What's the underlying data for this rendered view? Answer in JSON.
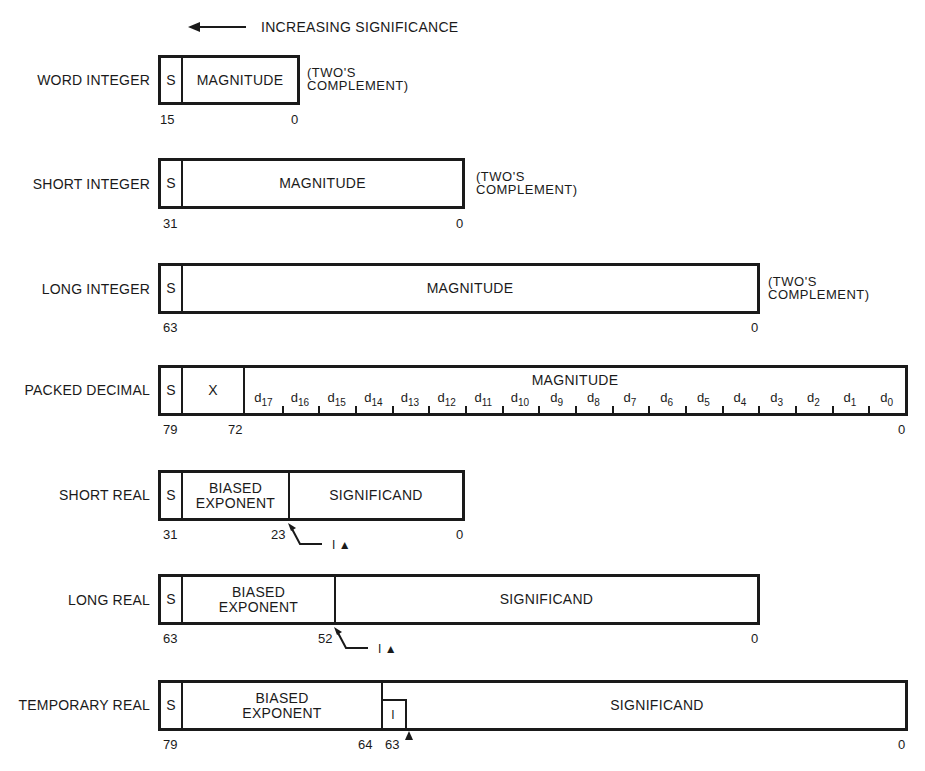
{
  "header": {
    "arrow_label": "INCREASING SIGNIFICANCE"
  },
  "formats": {
    "word_integer": {
      "label": "WORD INTEGER",
      "sign": "S",
      "field": "MAGNITUDE",
      "note_line1": "(TWO'S",
      "note_line2": "COMPLEMENT)",
      "bit_high": "15",
      "bit_low": "0"
    },
    "short_integer": {
      "label": "SHORT INTEGER",
      "sign": "S",
      "field": "MAGNITUDE",
      "note_line1": "(TWO'S",
      "note_line2": "COMPLEMENT)",
      "bit_high": "31",
      "bit_low": "0"
    },
    "long_integer": {
      "label": "LONG INTEGER",
      "sign": "S",
      "field": "MAGNITUDE",
      "note_line1": "(TWO'S",
      "note_line2": "COMPLEMENT)",
      "bit_high": "63",
      "bit_low": "0"
    },
    "packed_decimal": {
      "label": "PACKED DECIMAL",
      "sign": "S",
      "unused": "X",
      "field": "MAGNITUDE",
      "bit_high": "79",
      "bit_mid": "72",
      "bit_low": "0",
      "digits": [
        "17",
        "16",
        "15",
        "14",
        "13",
        "12",
        "11",
        "10",
        "9",
        "8",
        "7",
        "6",
        "5",
        "4",
        "3",
        "2",
        "1",
        "0"
      ]
    },
    "short_real": {
      "label": "SHORT REAL",
      "sign": "S",
      "exp_line1": "BIASED",
      "exp_line2": "EXPONENT",
      "field": "SIGNIFICAND",
      "bit_high": "31",
      "bit_mid": "23",
      "bit_low": "0",
      "implicit": "I ▲"
    },
    "long_real": {
      "label": "LONG REAL",
      "sign": "S",
      "exp_line1": "BIASED",
      "exp_line2": "EXPONENT",
      "field": "SIGNIFICAND",
      "bit_high": "63",
      "bit_mid": "52",
      "bit_low": "0",
      "implicit": "I ▲"
    },
    "temporary_real": {
      "label": "TEMPORARY REAL",
      "sign": "S",
      "exp_line1": "BIASED",
      "exp_line2": "EXPONENT",
      "integer_bit": "I",
      "field": "SIGNIFICAND",
      "bit_high": "79",
      "bit_mid": "64",
      "bit_mid2": "63",
      "bit_low": "0"
    }
  }
}
